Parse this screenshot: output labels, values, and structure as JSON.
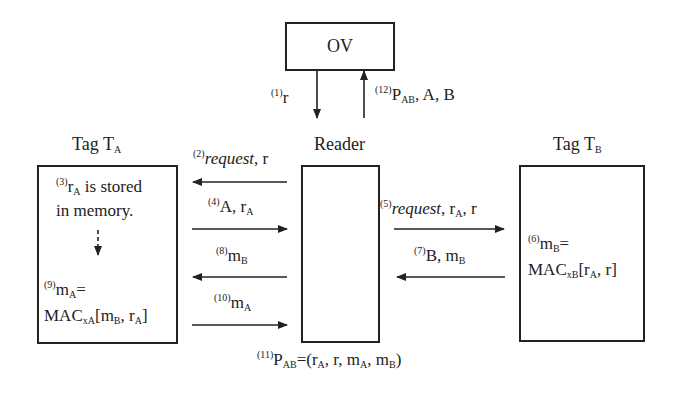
{
  "nodes": {
    "ov": {
      "label": "OV"
    },
    "reader": {
      "label": "Reader"
    },
    "tag_a": {
      "label_main": "Tag T",
      "label_sub": "A"
    },
    "tag_b": {
      "label_main": "Tag T",
      "label_sub": "B"
    }
  },
  "steps": {
    "s1": {
      "num": "(1)",
      "text": "r"
    },
    "s2": {
      "num": "(2)",
      "italic": "request",
      "text": ", r"
    },
    "s3": {
      "num": "(3)",
      "r": "r",
      "r_sub": "A",
      "text": " is stored",
      "line2": "in memory."
    },
    "s4": {
      "num": "(4)",
      "text": "A, r",
      "sub": "A"
    },
    "s5": {
      "num": "(5)",
      "italic": "request",
      "text": ", r",
      "sub": "A",
      "tail": ", r"
    },
    "s6": {
      "num": "(6)",
      "m": "m",
      "m_sub": "B",
      "eq": "=",
      "mac": "MAC",
      "mac_sub": "xB",
      "args_a": "[r",
      "args_a_sub": "A",
      "args_b": ", r]"
    },
    "s7": {
      "num": "(7)",
      "text": "B, m",
      "sub": "B"
    },
    "s8": {
      "num": "(8)",
      "text": "m",
      "sub": "B"
    },
    "s9": {
      "num": "(9)",
      "m": "m",
      "m_sub": "A",
      "eq": "=",
      "mac": "MAC",
      "mac_sub": "xA",
      "args_a": "[m",
      "args_a_sub": "B",
      "args_b": ", r",
      "args_b_sub": "A",
      "args_c": "]"
    },
    "s10": {
      "num": "(10)",
      "text": "m",
      "sub": "A"
    },
    "s11": {
      "num": "(11)",
      "p": "P",
      "p_sub": "AB",
      "eq": "=(r",
      "a_sub": "A",
      "mid": ", r, m",
      "ma_sub": "A",
      "mid2": ", m",
      "mb_sub": "B",
      "end": ")"
    },
    "s12": {
      "num": "(12)",
      "p": "P",
      "p_sub": "AB",
      "text": ", A, B"
    }
  },
  "colors": {
    "stroke": "#222222",
    "background": "#ffffff"
  }
}
